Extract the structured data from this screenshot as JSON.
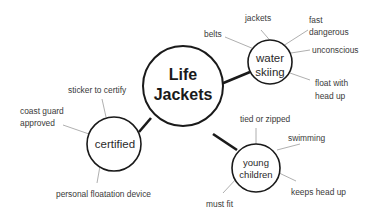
{
  "center": {
    "line1": "Life",
    "line2": "Jackets"
  },
  "branches": {
    "water_skiing": {
      "line1": "water",
      "line2": "skiing",
      "leaves": {
        "belts": "belts",
        "jackets": "jackets",
        "fast": "fast",
        "dangerous": "dangerous",
        "unconscious": "unconscious",
        "float_with": "float with",
        "head_up": "head up"
      }
    },
    "certified": {
      "label": "certified",
      "leaves": {
        "sticker": "sticker to certify",
        "coast_guard": "coast guard",
        "approved": "approved",
        "pfd": "personal floatation device"
      }
    },
    "young_children": {
      "line1": "young",
      "line2": "children",
      "leaves": {
        "tied": "tied or zipped",
        "swimming": "swimming",
        "keeps_head_up": "keeps head up",
        "must_fit": "must fit"
      }
    }
  },
  "colors": {
    "stroke": "#1a1a1a",
    "leaf_line": "#9a9a9a",
    "text": "#3a3a3a",
    "background": "#ffffff"
  }
}
